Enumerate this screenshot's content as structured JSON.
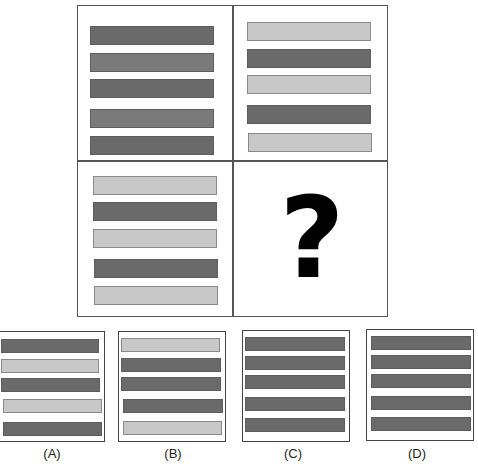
{
  "puzzle": {
    "matrix": {
      "top_left": {
        "bars": [
          "dark",
          "mid",
          "dark",
          "mid",
          "dark"
        ]
      },
      "top_right": {
        "bars": [
          "light",
          "dark",
          "light",
          "dark",
          "light"
        ]
      },
      "bottom_left": {
        "bars": [
          "light",
          "dark",
          "light",
          "dark",
          "light"
        ]
      },
      "bottom_right": {
        "placeholder": "?"
      }
    },
    "options": [
      {
        "label": "(A)",
        "bars": [
          "dark",
          "light",
          "dark",
          "light",
          "dark"
        ]
      },
      {
        "label": "(B)",
        "bars": [
          "light",
          "dark",
          "dark",
          "dark",
          "light"
        ]
      },
      {
        "label": "(C)",
        "bars": [
          "dark",
          "dark",
          "dark",
          "dark",
          "dark"
        ]
      },
      {
        "label": "(D)",
        "bars": [
          "dark",
          "dark",
          "dark",
          "dark",
          "dark"
        ]
      }
    ]
  },
  "colors": {
    "dark": "#6a6a6a",
    "mid": "#7a7a7a",
    "light": "#c8c8c8",
    "border": "#555555"
  }
}
